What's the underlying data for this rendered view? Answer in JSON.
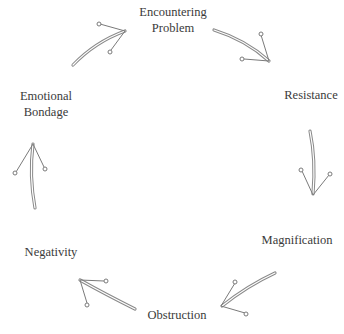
{
  "diagram": {
    "type": "cycle",
    "direction": "clockwise",
    "nodes": [
      {
        "id": "encountering-problem",
        "line1": "Encountering",
        "line2": "Problem"
      },
      {
        "id": "resistance",
        "line1": "Resistance"
      },
      {
        "id": "magnification",
        "line1": "Magnification"
      },
      {
        "id": "obstruction",
        "line1": "Obstruction"
      },
      {
        "id": "negativity",
        "line1": "Negativity"
      },
      {
        "id": "emotional-bondage",
        "line1": "Emotional",
        "line2": "Bondage"
      }
    ],
    "edges": [
      {
        "from": "encountering-problem",
        "to": "resistance"
      },
      {
        "from": "resistance",
        "to": "magnification"
      },
      {
        "from": "magnification",
        "to": "obstruction"
      },
      {
        "from": "obstruction",
        "to": "negativity"
      },
      {
        "from": "negativity",
        "to": "emotional-bondage"
      },
      {
        "from": "emotional-bondage",
        "to": "encountering-problem"
      }
    ],
    "colors": {
      "text": "#3a3a3a",
      "arrow": "#8a8a8a",
      "background": "#ffffff"
    }
  }
}
